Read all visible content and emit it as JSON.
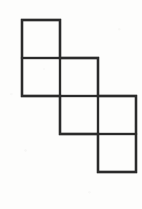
{
  "figure": {
    "name": "polyomino-staircase",
    "square_count": 6,
    "background_color": "#fdfdfc",
    "stroke_color": "#2b2b2b",
    "stroke_width": 2.2,
    "fill_color": "none",
    "unit_size": 38,
    "origin": {
      "x": 22,
      "y": 20
    },
    "squares": [
      {
        "label": "square-r1c0",
        "row": 0,
        "col": 0,
        "x": 22,
        "y": 20,
        "w": 38,
        "h": 38
      },
      {
        "label": "square-r2c0",
        "row": 1,
        "col": 0,
        "x": 22,
        "y": 58,
        "w": 38,
        "h": 38
      },
      {
        "label": "square-r2c1",
        "row": 1,
        "col": 1,
        "x": 60,
        "y": 58,
        "w": 38,
        "h": 38
      },
      {
        "label": "square-r3c1",
        "row": 2,
        "col": 1,
        "x": 60,
        "y": 96,
        "w": 38,
        "h": 38
      },
      {
        "label": "square-r3c2",
        "row": 2,
        "col": 2,
        "x": 98,
        "y": 96,
        "w": 38,
        "h": 38
      },
      {
        "label": "square-r4c2",
        "row": 3,
        "col": 2,
        "x": 98,
        "y": 134,
        "w": 38,
        "h": 38
      }
    ],
    "outline_path": "M22,20 L60,20 L60,58 L98,58 L98,96 L136,96 L136,172 L98,172 L98,134 L60,134 L60,96 L22,96 Z",
    "interior_segments": [
      {
        "label": "divider-h-row1-row2",
        "x1": 22,
        "y1": 58,
        "x2": 60,
        "y2": 58
      },
      {
        "label": "divider-v-row2",
        "x1": 60,
        "y1": 58,
        "x2": 60,
        "y2": 96
      },
      {
        "label": "divider-h-row2-row3",
        "x1": 60,
        "y1": 96,
        "x2": 98,
        "y2": 96
      },
      {
        "label": "divider-v-row3",
        "x1": 98,
        "y1": 96,
        "x2": 98,
        "y2": 134
      },
      {
        "label": "divider-h-row3-row4",
        "x1": 98,
        "y1": 134,
        "x2": 136,
        "y2": 134
      }
    ]
  },
  "chart_data": {
    "type": "table",
    "title": "",
    "xlabel": "",
    "ylabel": "",
    "categories": [
      "row 1",
      "row 2",
      "row 3",
      "row 4"
    ],
    "values": [
      1,
      2,
      2,
      1
    ],
    "grid": true,
    "legend": "none",
    "xlim": [
      0,
      3
    ],
    "ylim": [
      0,
      4
    ]
  }
}
